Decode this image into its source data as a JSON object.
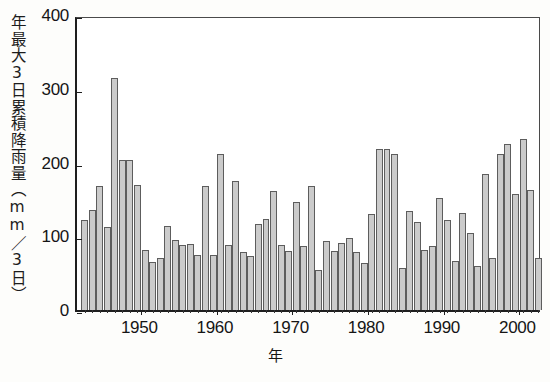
{
  "chart_data": {
    "type": "bar",
    "title": "",
    "xlabel": "年",
    "ylabel": "年最大3日累積降雨量（mm／3日）",
    "ylim": [
      0,
      400
    ],
    "yticks": [
      0,
      100,
      200,
      300,
      400
    ],
    "ytick_labels": [
      "0",
      "100",
      "200",
      "300",
      "400"
    ],
    "xlim": [
      1941.5,
      2003.0
    ],
    "xticks": [
      1950,
      1960,
      1970,
      1980,
      1990,
      2000
    ],
    "xtick_labels": [
      "1950",
      "1960",
      "1970",
      "1980",
      "1990",
      "2000"
    ],
    "grid": false,
    "legend": null,
    "bar_color": "#cbcbcb",
    "bar_edge_color": "#5d5d5d",
    "axis_color": "#1e1e1e",
    "categories": [
      1942,
      1943,
      1944,
      1945,
      1946,
      1947,
      1948,
      1949,
      1950,
      1951,
      1952,
      1953,
      1954,
      1955,
      1956,
      1957,
      1958,
      1959,
      1960,
      1961,
      1962,
      1963,
      1964,
      1965,
      1966,
      1967,
      1968,
      1969,
      1970,
      1971,
      1972,
      1973,
      1974,
      1975,
      1976,
      1977,
      1978,
      1979,
      1980,
      1981,
      1982,
      1983,
      1984,
      1985,
      1986,
      1987,
      1988,
      1989,
      1990,
      1991,
      1992,
      1993,
      1994,
      1995,
      1996,
      1997,
      1998,
      1999,
      2000,
      2001,
      2002
    ],
    "values": [
      122,
      135,
      168,
      113,
      315,
      203,
      203,
      170,
      82,
      65,
      70,
      114,
      95,
      88,
      90,
      75,
      168,
      75,
      212,
      88,
      175,
      78,
      73,
      116,
      124,
      161,
      88,
      80,
      147,
      87,
      168,
      54,
      94,
      80,
      91,
      98,
      78,
      64,
      130,
      219,
      219,
      212,
      57,
      134,
      119,
      82,
      87,
      152,
      122,
      67,
      132,
      105,
      60,
      185,
      70,
      212,
      225,
      157,
      232,
      163,
      70
    ]
  }
}
